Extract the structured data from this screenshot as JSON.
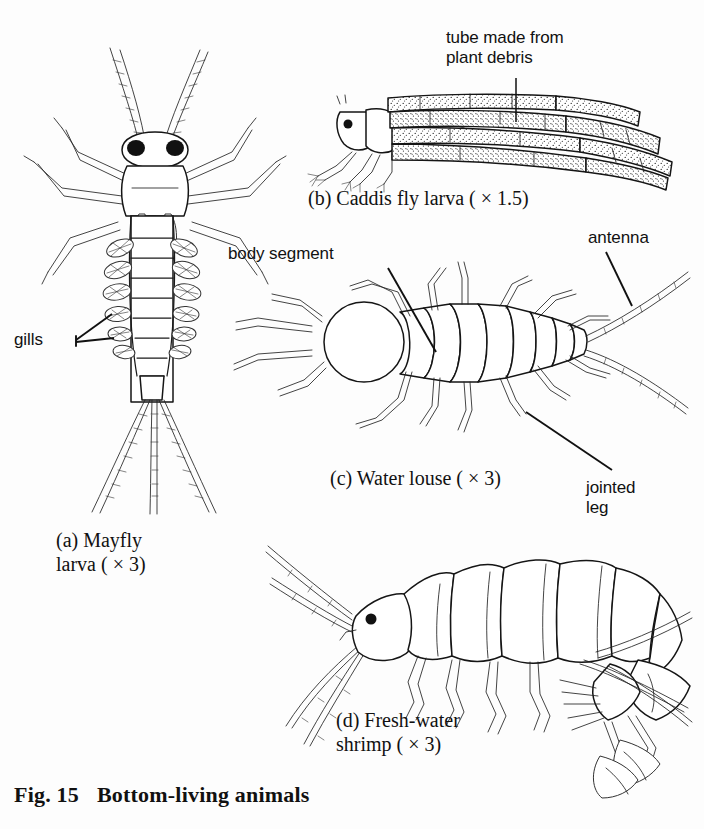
{
  "figure": {
    "number": "Fig. 15",
    "title": "Bottom-living animals",
    "background_color": "#fdfdfd",
    "ink_color": "#111111"
  },
  "specimens": [
    {
      "key": "mayfly",
      "letter": "(a)",
      "name": "Mayfly\nlarva",
      "magnification": "( × 3)",
      "caption": "(a) Mayfly\nlarva ( × 3)"
    },
    {
      "key": "caddis",
      "letter": "(b)",
      "name": "Caddis fly larva",
      "magnification": "( × 1.5)",
      "caption": "(b) Caddis fly larva ( × 1.5)"
    },
    {
      "key": "water_louse",
      "letter": "(c)",
      "name": "Water louse",
      "magnification": "( × 3)",
      "caption": "(c) Water louse ( × 3)"
    },
    {
      "key": "shrimp",
      "letter": "(d)",
      "name": "Fresh-water\nshrimp",
      "magnification": "( × 3)",
      "caption": "(d) Fresh-water\nshrimp ( × 3)"
    }
  ],
  "annotations": [
    {
      "key": "tube",
      "text": "tube made from\nplant debris",
      "points_to": "caddis-tube"
    },
    {
      "key": "gills",
      "text": "gills",
      "points_to": "mayfly-gills"
    },
    {
      "key": "body_segment",
      "text": "body segment",
      "points_to": "louse-segment"
    },
    {
      "key": "antenna",
      "text": "antenna",
      "points_to": "louse-antenna"
    },
    {
      "key": "jointed_leg",
      "text": "jointed\nleg",
      "points_to": "louse-leg"
    }
  ]
}
